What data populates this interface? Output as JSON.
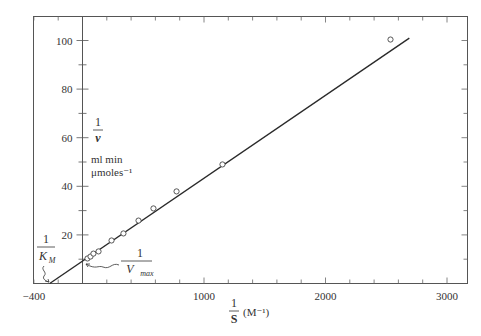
{
  "chart_data": {
    "type": "scatter",
    "title": "",
    "subtitle": "Lineweaver-Burk double-reciprocal plot",
    "xlabel": "1/S (M^-1)",
    "xlabel_parts": {
      "numerator": "1",
      "denominator": "S",
      "unit": "(M⁻¹)"
    },
    "ylabel": "1/v ml min μmoles^-1",
    "ylabel_parts": {
      "numerator": "1",
      "denominator": "v",
      "unit_line1": "ml min",
      "unit_line2": "μmoles⁻¹"
    },
    "xlim": [
      -400,
      3200
    ],
    "ylim": [
      0,
      110
    ],
    "grid": false,
    "legend": null,
    "x_ticks": [
      -400,
      1000,
      2000,
      3000
    ],
    "x_tick_labels": [
      "−400",
      "1000",
      "2000",
      "3000"
    ],
    "x_minor_step": 200,
    "y_ticks": [
      20,
      40,
      60,
      80,
      100
    ],
    "y_tick_labels": [
      "20",
      "40",
      "60",
      "80",
      "100"
    ],
    "y_minor_step": 10,
    "series": [
      {
        "name": "measured",
        "marker": "open-circle",
        "points": [
          {
            "x": 41,
            "y": 10.3
          },
          {
            "x": 66,
            "y": 11.1
          },
          {
            "x": 90,
            "y": 12.3
          },
          {
            "x": 132,
            "y": 13.2
          },
          {
            "x": 239,
            "y": 17.7
          },
          {
            "x": 337,
            "y": 20.6
          },
          {
            "x": 461,
            "y": 25.9
          },
          {
            "x": 584,
            "y": 30.9
          },
          {
            "x": 774,
            "y": 37.9
          },
          {
            "x": 1152,
            "y": 49.0
          },
          {
            "x": 2535,
            "y": 100.4
          }
        ]
      },
      {
        "name": "fit line",
        "type": "line",
        "points": [
          {
            "x": -270,
            "y": 0
          },
          {
            "x": 2690,
            "y": 101
          }
        ]
      }
    ],
    "annotations": [
      {
        "text": "1/K_M",
        "numerator": "1",
        "denominator": "K",
        "subscript": "M",
        "points_to": {
          "x": -270,
          "y": 0
        }
      },
      {
        "text": "1/V_max",
        "numerator": "1",
        "denominator": "V",
        "subscript": "max",
        "points_to": {
          "x": 0,
          "y": 9.2
        }
      }
    ]
  },
  "labels": {
    "x_numerator": "1",
    "x_denominator": "S",
    "x_unit": "(M⁻¹)",
    "y_numerator": "1",
    "y_denominator": "v",
    "y_unit1": "ml min",
    "y_unit2": "μmoles⁻¹",
    "km_numerator": "1",
    "km_denominator": "K",
    "km_sub": "M",
    "vmax_numerator": "1",
    "vmax_denominator": "V",
    "vmax_sub": "max"
  },
  "colors": {
    "axis": "#555555",
    "line": "#2a2a2a",
    "marker_stroke": "#444444",
    "background": "#ffffff"
  }
}
